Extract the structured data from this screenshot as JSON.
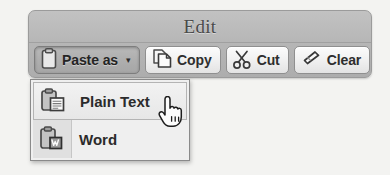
{
  "window": {
    "title": "Edit"
  },
  "toolbar": {
    "buttons": [
      {
        "label": "Paste as",
        "icon": "clipboard-icon",
        "state": "pressed",
        "has_caret": true,
        "caret": "▾"
      },
      {
        "label": "Copy",
        "icon": "copy-pages-icon",
        "state": "normal",
        "has_caret": false,
        "caret": ""
      },
      {
        "label": "Cut",
        "icon": "scissors-icon",
        "state": "normal",
        "has_caret": false,
        "caret": ""
      },
      {
        "label": "Clear",
        "icon": "eraser-icon",
        "state": "normal",
        "has_caret": false,
        "caret": ""
      }
    ]
  },
  "dropdown": {
    "open": true,
    "items": [
      {
        "label": "Plain Text",
        "icon": "clipboard-text-icon",
        "hovered": true
      },
      {
        "label": "Word",
        "icon": "clipboard-word-icon",
        "hovered": false
      }
    ]
  },
  "cursor": {
    "type": "pointing-hand-cursor"
  },
  "colors": {
    "panel_background": "#b6b6b6",
    "panel_border": "#9b9b9b",
    "button_face": "#f0f0f0",
    "button_pressed": "#aeaeae",
    "button_border": "#8f8f8f",
    "menu_background": "#efefef",
    "menu_gutter": "#e0e0e0",
    "menu_border": "#8a8a8a",
    "menu_hover": "#e7e7e7",
    "title_text": "#4a4a4a",
    "label_text": "#2e2e2e",
    "page_background": "#f3f3f1"
  }
}
